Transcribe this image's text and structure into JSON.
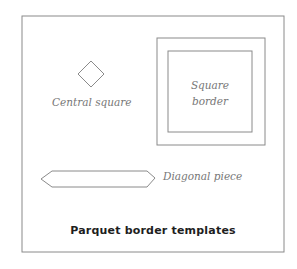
{
  "figure": {
    "title": "Parquet border templates",
    "colors": {
      "background": "#ffffff",
      "frame_stroke": "#8a8a8a",
      "shape_stroke": "#8a8a8a",
      "label_text": "#777777",
      "title_text": "#1e1e1e"
    }
  },
  "shapes": {
    "central_square": {
      "label": "Central square",
      "icon": "diamond-shape"
    },
    "square_border": {
      "label_line1": "Square",
      "label_line2": "border",
      "icon": "nested-squares-shape"
    },
    "diagonal_piece": {
      "label": "Diagonal piece",
      "icon": "elongated-hexagon-shape"
    }
  }
}
